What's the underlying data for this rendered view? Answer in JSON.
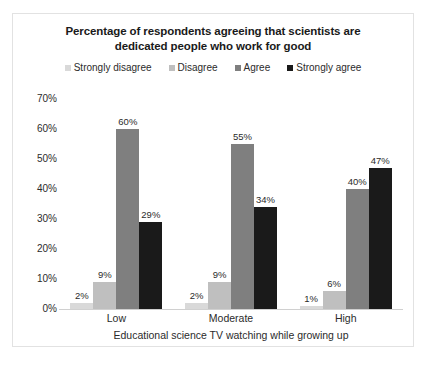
{
  "chart_data": {
    "type": "bar",
    "title": "Percentage of respondents agreeing that scientists are dedicated people who work for good",
    "title_line1": "Percentage of respondents agreeing that scientists are",
    "title_line2": "dedicated people who work for good",
    "xlabel": "Educational science TV watching while growing up",
    "ylabel": "",
    "categories": [
      "Low",
      "Moderate",
      "High"
    ],
    "series": [
      {
        "name": "Strongly disagree",
        "color": "#d9d9d9",
        "values": [
          2,
          2,
          1
        ],
        "labels": [
          "2%",
          "2%",
          "1%"
        ]
      },
      {
        "name": "Disagree",
        "color": "#bfbfbf",
        "values": [
          9,
          9,
          6
        ],
        "labels": [
          "9%",
          "9%",
          "6%"
        ]
      },
      {
        "name": "Agree",
        "color": "#7f7f7f",
        "values": [
          60,
          55,
          40
        ],
        "labels": [
          "60%",
          "55%",
          "40%"
        ]
      },
      {
        "name": "Strongly agree",
        "color": "#1a1a1a",
        "values": [
          29,
          34,
          47
        ],
        "labels": [
          "29%",
          "34%",
          "47%"
        ]
      }
    ],
    "ylim": [
      0,
      70
    ],
    "yticks": [
      0,
      10,
      20,
      30,
      40,
      50,
      60,
      70
    ],
    "ytick_labels": [
      "0%",
      "10%",
      "20%",
      "30%",
      "40%",
      "50%",
      "60%",
      "70%"
    ],
    "grid": false,
    "legend_position": "top",
    "value_labels": true,
    "units": "percent"
  }
}
